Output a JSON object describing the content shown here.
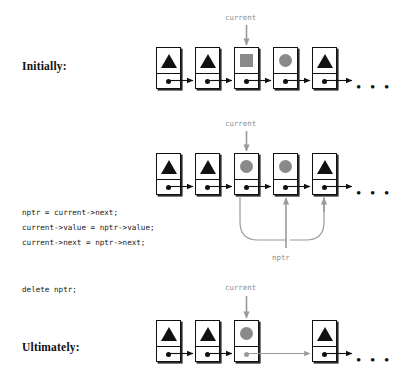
{
  "figure": {
    "title_rows": [
      {
        "key": "initially",
        "label": "Initially:"
      },
      {
        "key": "ultimately",
        "label": "Ultimately:"
      }
    ],
    "pointer_labels": {
      "current": "current",
      "nptr": "nptr"
    },
    "ellipsis": "• • •"
  },
  "code": {
    "block1": [
      "nptr = current->next;",
      "current->value = nptr->value;",
      "current->next = nptr->next;"
    ],
    "block2": [
      "delete nptr;"
    ]
  },
  "rows": [
    {
      "name": "initially",
      "label": "Initially:",
      "pointer": "current",
      "pointer_target_index": 2,
      "nodes": [
        {
          "value": "triangle",
          "value_color": "#111111",
          "next": "dot",
          "next_color": "#111111"
        },
        {
          "value": "triangle",
          "value_color": "#111111",
          "next": "dot",
          "next_color": "#111111"
        },
        {
          "value": "square",
          "value_color": "#8a8a8a",
          "next": "dot",
          "next_color": "#111111"
        },
        {
          "value": "circle",
          "value_color": "#8a8a8a",
          "next": "dot",
          "next_color": "#111111"
        },
        {
          "value": "triangle",
          "value_color": "#111111",
          "next": "dot",
          "next_color": "#111111"
        }
      ]
    },
    {
      "name": "after-assign",
      "label": "",
      "pointer": "current",
      "pointer_target_index": 2,
      "nodes": [
        {
          "value": "triangle",
          "value_color": "#111111",
          "next": "dot",
          "next_color": "#111111"
        },
        {
          "value": "triangle",
          "value_color": "#111111",
          "next": "dot",
          "next_color": "#111111"
        },
        {
          "value": "circle",
          "value_color": "#8a8a8a",
          "next": "dot",
          "next_color": "#111111"
        },
        {
          "value": "circle",
          "value_color": "#8a8a8a",
          "next": "dot",
          "next_color": "#111111"
        },
        {
          "value": "triangle",
          "value_color": "#111111",
          "next": "dot",
          "next_color": "#111111"
        }
      ]
    },
    {
      "name": "ultimately",
      "label": "Ultimately:",
      "pointer": "current",
      "pointer_target_index": 2,
      "nodes": [
        {
          "value": "triangle",
          "value_color": "#111111",
          "next": "dot",
          "next_color": "#111111"
        },
        {
          "value": "triangle",
          "value_color": "#111111",
          "next": "dot",
          "next_color": "#111111"
        },
        {
          "value": "circle",
          "value_color": "#8a8a8a",
          "next": "dot",
          "next_color": "#9a9a9a"
        },
        {
          "value": "triangle",
          "value_color": "#111111",
          "next": "dot",
          "next_color": "#111111"
        }
      ]
    }
  ],
  "colors": {
    "ink": "#111111",
    "gray_fill": "#8a8a8a",
    "pointer_gray": "#8e8e8e",
    "paper": "#ffffff"
  }
}
